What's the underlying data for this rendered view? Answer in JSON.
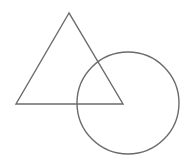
{
  "canvas": {
    "width": 191,
    "height": 163,
    "background": "#ffffff"
  },
  "stroke": {
    "color": "#6b6b6b",
    "width": 1.4
  },
  "shapes": {
    "triangle": {
      "points": "69,13 16,104 123,104"
    },
    "circle": {
      "cx": 128,
      "cy": 103,
      "r": 51
    }
  }
}
